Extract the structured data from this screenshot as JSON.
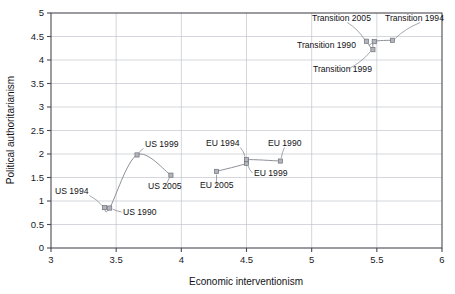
{
  "chart_data": {
    "type": "scatter",
    "title": "",
    "xlabel": "Economic interventionism",
    "ylabel": "Political authoritarianism",
    "xlim": [
      3,
      6
    ],
    "ylim": [
      0,
      5
    ],
    "xticks": [
      "3",
      "3.5",
      "4",
      "4.5",
      "5",
      "5.5",
      "6"
    ],
    "xtick_values": [
      3,
      3.5,
      4,
      4.5,
      5,
      5.5,
      6
    ],
    "yticks": [
      "0",
      "0.5",
      "1",
      "1.5",
      "2",
      "2.5",
      "3",
      "3.5",
      "4",
      "4.5",
      "5"
    ],
    "ytick_values": [
      0,
      0.5,
      1,
      1.5,
      2,
      2.5,
      3,
      3.5,
      4,
      4.5,
      5
    ],
    "grid": "horizontal-and-vertical",
    "legend": "none",
    "series": [
      {
        "name": "US",
        "points": [
          {
            "label": "US 1990",
            "x": 3.45,
            "y": 0.85
          },
          {
            "label": "US 1994",
            "x": 3.41,
            "y": 0.86
          },
          {
            "label": "US 1999",
            "x": 3.66,
            "y": 1.98
          },
          {
            "label": "US 2005",
            "x": 3.92,
            "y": 1.55
          }
        ]
      },
      {
        "name": "EU",
        "points": [
          {
            "label": "EU 1990",
            "x": 4.76,
            "y": 1.85
          },
          {
            "label": "EU 1994",
            "x": 4.5,
            "y": 1.88
          },
          {
            "label": "EU 1999",
            "x": 4.5,
            "y": 1.8
          },
          {
            "label": "EU 2005",
            "x": 4.27,
            "y": 1.63
          }
        ]
      },
      {
        "name": "Transition",
        "points": [
          {
            "label": "Transition 1990",
            "x": 5.48,
            "y": 4.39
          },
          {
            "label": "Transition 1994",
            "x": 5.62,
            "y": 4.42
          },
          {
            "label": "Transition 1999",
            "x": 5.47,
            "y": 4.22
          },
          {
            "label": "Transition 2005",
            "x": 5.42,
            "y": 4.4
          }
        ]
      }
    ],
    "annotations": [
      {
        "text": "US 1994",
        "x": 55,
        "y": 194
      },
      {
        "text": "US 1990",
        "x": 123,
        "y": 215
      },
      {
        "text": "US 1999",
        "x": 145,
        "y": 147
      },
      {
        "text": "US 2005",
        "x": 148,
        "y": 189
      },
      {
        "text": "EU 1994",
        "x": 206,
        "y": 146
      },
      {
        "text": "EU 1990",
        "x": 268,
        "y": 146
      },
      {
        "text": "EU 1999",
        "x": 254,
        "y": 176
      },
      {
        "text": "EU 2005",
        "x": 200,
        "y": 188
      },
      {
        "text": "Transition 2005",
        "x": 312,
        "y": 21
      },
      {
        "text": "Transition 1994",
        "x": 385,
        "y": 21
      },
      {
        "text": "Transition 1990",
        "x": 297,
        "y": 48
      },
      {
        "text": "Transition 1999",
        "x": 313,
        "y": 72
      }
    ],
    "colors": {
      "axis": "#4a4a52",
      "grid": "#b9bcc4",
      "series_line": "#8d9099",
      "marker_fill": "#b2b5bc",
      "marker_stroke": "#6e717a",
      "text": "#111115",
      "background": "#ffffff"
    }
  }
}
